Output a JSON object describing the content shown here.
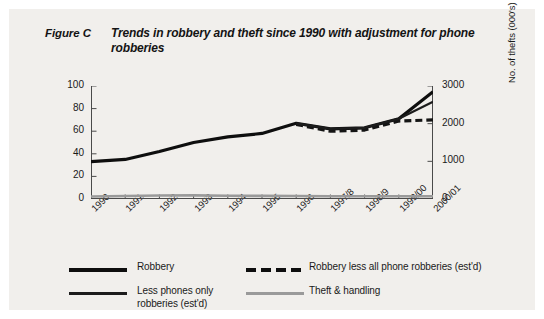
{
  "figure": {
    "label": "Figure C",
    "title": "Trends in robbery and theft since 1990 with adjustment for phone robberies",
    "background_color": "#f1efec",
    "border_color": "#ffffff"
  },
  "chart_data": {
    "type": "line",
    "title": "Trends in robbery and theft since 1990 with adjustment for phone robberies",
    "xlabel": "",
    "ylabel": "No. of robberies (000's)",
    "y2label": "No. of thefts (000's)",
    "grid": false,
    "legend_position": "bottom",
    "categories": [
      "1990",
      "1991",
      "1992",
      "1993",
      "1994",
      "1995",
      "1996",
      "1997/8",
      "1998/9",
      "1999/00",
      "2000/01"
    ],
    "ylim": [
      0,
      100
    ],
    "yticks": [
      0,
      20,
      40,
      60,
      80,
      100
    ],
    "y2lim": [
      0,
      3000
    ],
    "y2ticks": [
      0,
      1000,
      2000,
      3000
    ],
    "series": [
      {
        "name": "Robbery",
        "color": "#0e0e0e",
        "style": "solid",
        "width": 3.2,
        "axis": "left",
        "values": [
          33,
          35,
          42,
          50,
          55,
          58,
          67,
          62,
          63,
          71,
          95
        ]
      },
      {
        "name": "Robbery less all phone robberies (est'd)",
        "color": "#141414",
        "style": "dashed",
        "width": 3.2,
        "axis": "left",
        "values": [
          null,
          null,
          null,
          null,
          null,
          null,
          66,
          60,
          61,
          69,
          70
        ]
      },
      {
        "name": "Less phones only robberies (est'd)",
        "color": "#1c1c1c",
        "style": "solid",
        "width": 2.2,
        "axis": "left",
        "values": [
          null,
          null,
          null,
          null,
          null,
          null,
          67,
          62,
          63,
          71,
          86
        ]
      },
      {
        "name": "Theft & handling",
        "color": "#9a9a9a",
        "style": "solid",
        "width": 2.6,
        "axis": "right",
        "values": [
          68,
          78,
          92,
          95,
          88,
          83,
          81,
          73,
          73,
          72,
          72
        ]
      }
    ]
  },
  "legend": {
    "items": [
      {
        "label": "Robbery",
        "swatch": "solid-thick",
        "color": "#0e0e0e"
      },
      {
        "label": "Robbery less all phone robberies (est'd)",
        "swatch": "dash",
        "color": "#0e0e0e"
      },
      {
        "label": "Less phones only robberies (est'd)",
        "swatch": "solid-thin",
        "color": "#1c1c1c"
      },
      {
        "label": "Theft & handling",
        "swatch": "solid-gray",
        "color": "#9a9a9a"
      }
    ]
  }
}
